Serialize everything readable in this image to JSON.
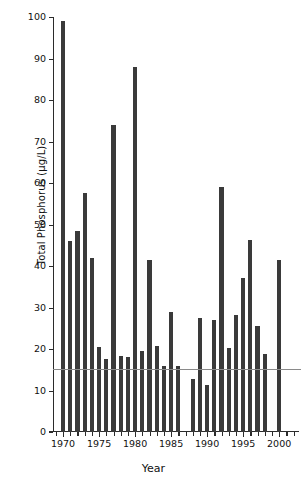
{
  "chart_data": {
    "type": "bar",
    "title": "",
    "xlabel": "Year",
    "ylabel": "Total Phosphorus (µg/L)",
    "xlim": [
      1968.6,
      2002.2
    ],
    "ylim": [
      0,
      100
    ],
    "y_ticks": [
      0,
      10,
      20,
      30,
      40,
      50,
      60,
      70,
      80,
      90,
      100
    ],
    "y_tick_labels": [
      "0",
      "10",
      "20",
      "30",
      "40",
      "50",
      "60",
      "70",
      "80",
      "90",
      "100"
    ],
    "x_ticks": [
      1970,
      1975,
      1980,
      1985,
      1990,
      1995,
      2000
    ],
    "x_tick_labels": [
      "1970",
      "1975",
      "1980",
      "1985",
      "1990",
      "1995",
      "2000"
    ],
    "x_minor_ticks": [
      1969,
      1971,
      1972,
      1973,
      1974,
      1976,
      1977,
      1978,
      1979,
      1981,
      1982,
      1983,
      1984,
      1986,
      1987,
      1988,
      1989,
      1991,
      1992,
      1993,
      1994,
      1996,
      1997,
      1998,
      1999,
      2001,
      2002
    ],
    "grid": false,
    "legend": null,
    "bar_color": "#3a3a3a",
    "reference_line": {
      "value": 15.2,
      "color": "#8a8a8a",
      "orientation": "horizontal"
    },
    "categories": [
      1970,
      1971,
      1972,
      1973,
      1974,
      1975,
      1976,
      1977,
      1978,
      1979,
      1980,
      1981,
      1982,
      1983,
      1984,
      1985,
      1986,
      1987,
      1989,
      1990,
      1991,
      1992,
      1993,
      1994,
      1995,
      1996,
      1997,
      1998,
      1999,
      2001
    ],
    "values": [
      99.0,
      46.0,
      48.5,
      57.5,
      42.0,
      20.5,
      17.5,
      74.0,
      18.2,
      18.1,
      88.0,
      19.6,
      41.5,
      20.8,
      16.0,
      29.0,
      15.8,
      12.8,
      27.4,
      11.3,
      27.1,
      59.0,
      20.3,
      28.3,
      37.0,
      46.3,
      25.5,
      18.9,
      41.5,
      41.5
    ]
  },
  "series_points": [
    {
      "year": 1970,
      "value": 99.0
    },
    {
      "year": 1971,
      "value": 46.0
    },
    {
      "year": 1972,
      "value": 48.5
    },
    {
      "year": 1973,
      "value": 57.5
    },
    {
      "year": 1974,
      "value": 42.0
    },
    {
      "year": 1975,
      "value": 20.5
    },
    {
      "year": 1976,
      "value": 17.5
    },
    {
      "year": 1977,
      "value": 74.0
    },
    {
      "year": 1978,
      "value": 18.2
    },
    {
      "year": 1979,
      "value": 18.1
    },
    {
      "year": 1980,
      "value": 88.0
    },
    {
      "year": 1981,
      "value": 19.6
    },
    {
      "year": 1982,
      "value": 41.5
    },
    {
      "year": 1983,
      "value": 20.8
    },
    {
      "year": 1984,
      "value": 16.0
    },
    {
      "year": 1985,
      "value": 29.0
    },
    {
      "year": 1986,
      "value": 15.8
    },
    {
      "year": 1988,
      "value": 12.8
    },
    {
      "year": 1989,
      "value": 27.4
    },
    {
      "year": 1990,
      "value": 11.3
    },
    {
      "year": 1991,
      "value": 27.1
    },
    {
      "year": 1992,
      "value": 59.0
    },
    {
      "year": 1993,
      "value": 20.3
    },
    {
      "year": 1994,
      "value": 28.3
    },
    {
      "year": 1995,
      "value": 37.0
    },
    {
      "year": 1996,
      "value": 46.3
    },
    {
      "year": 1997,
      "value": 25.5
    },
    {
      "year": 1998,
      "value": 18.9
    },
    {
      "year": 2000,
      "value": 41.5
    }
  ]
}
